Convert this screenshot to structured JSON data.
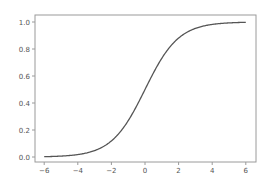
{
  "chart_data": {
    "type": "line",
    "title": "",
    "xlabel": "",
    "ylabel": "",
    "xlim": [
      -6.5,
      6.6
    ],
    "ylim": [
      -0.04,
      1.05
    ],
    "grid": false,
    "legend": null,
    "x_ticks": [
      -6,
      -4,
      -2,
      0,
      2,
      4,
      6
    ],
    "x_tick_labels": [
      "−6",
      "−4",
      "−2",
      "0",
      "2",
      "4",
      "6"
    ],
    "y_ticks": [
      0.0,
      0.2,
      0.4,
      0.6,
      0.8,
      1.0
    ],
    "y_tick_labels": [
      "0.0",
      "0.2",
      "0.4",
      "0.6",
      "0.8",
      "1.0"
    ],
    "series": [
      {
        "name": "sigmoid",
        "color": "#555555",
        "function": "1/(1+exp(-x))",
        "x": [
          -6,
          -5,
          -4,
          -3,
          -2,
          -1,
          0,
          1,
          2,
          3,
          4,
          5,
          6
        ],
        "y": [
          0.0025,
          0.0067,
          0.018,
          0.047,
          0.119,
          0.269,
          0.5,
          0.731,
          0.881,
          0.953,
          0.982,
          0.993,
          0.9975
        ]
      }
    ]
  },
  "colors": {
    "axes": "#9a9a9a",
    "line": "#555555",
    "text": "#555555",
    "background": "#ffffff"
  }
}
